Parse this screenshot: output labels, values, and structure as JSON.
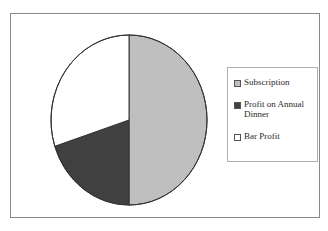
{
  "figure": {
    "background_color": "#ffffff",
    "frame_color": "#8a8a8a"
  },
  "legend": {
    "border_color": "#b0b0b0",
    "position": "right",
    "entries": [
      {
        "label": "Subscription",
        "color": "#bfbfbf",
        "swatch_name": "legend-swatch-subscription"
      },
      {
        "label": "Profit on Annual Dinner",
        "color": "#404040",
        "swatch_name": "legend-swatch-profit-on-annual-dinner"
      },
      {
        "label": "Bar Profit",
        "color": "#ffffff",
        "swatch_name": "legend-swatch-bar-profit"
      }
    ]
  },
  "chart_data": {
    "type": "pie",
    "title": "",
    "subtitle": "",
    "xlabel": "",
    "ylabel": "",
    "grid": false,
    "legend_position": "right",
    "start_angle_deg": 0,
    "direction": "clockwise",
    "categories": [
      "Subscription",
      "Profit on Annual Dinner",
      "Bar Profit"
    ],
    "values": [
      50,
      20,
      30
    ],
    "value_unit": "percent",
    "colors": [
      "#bfbfbf",
      "#404040",
      "#ffffff"
    ],
    "slice_outline_color": "#333333",
    "slices": [
      {
        "label": "Subscription",
        "value": 50,
        "color": "#bfbfbf",
        "start_deg": 0,
        "end_deg": 180
      },
      {
        "label": "Profit on Annual Dinner",
        "value": 20,
        "color": "#404040",
        "start_deg": 180,
        "end_deg": 252
      },
      {
        "label": "Bar Profit",
        "value": 30,
        "color": "#ffffff",
        "start_deg": 252,
        "end_deg": 360
      }
    ]
  }
}
